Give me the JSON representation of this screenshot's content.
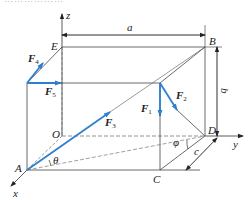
{
  "header": {
    "cropped_caption_text": "………………"
  },
  "diagram": {
    "type": "3D force system on rectangular box",
    "axes": {
      "x": "x",
      "y": "y",
      "z": "z",
      "origin": "O"
    },
    "points": {
      "A": "A",
      "B": "B",
      "C": "C",
      "D": "D",
      "E": "E",
      "O": "O"
    },
    "dimensions": {
      "a": "a",
      "b": "b",
      "c": "c"
    },
    "angles": {
      "theta": "θ",
      "phi": "φ"
    },
    "forces": [
      {
        "name": "F",
        "sub": "1"
      },
      {
        "name": "F",
        "sub": "2"
      },
      {
        "name": "F",
        "sub": "3"
      },
      {
        "name": "F",
        "sub": "4"
      },
      {
        "name": "F",
        "sub": "5"
      }
    ],
    "colors": {
      "force": "#2f7fd0",
      "line": "#333333",
      "dashed": "#777777"
    }
  }
}
